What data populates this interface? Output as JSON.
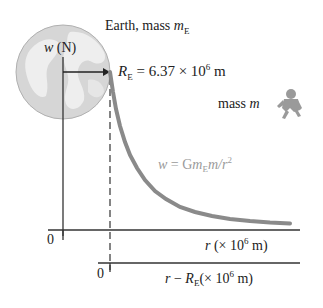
{
  "earth_label": {
    "text": "Earth, mass ",
    "var": "m",
    "sub": "E"
  },
  "y_axis_label": {
    "var": "w",
    "unit": " (N)"
  },
  "radius_label": {
    "var": "R",
    "sub": "E",
    "eq": " = 6.37 × 10",
    "exp": "6",
    "unit": " m"
  },
  "mass_label": {
    "text": "mass ",
    "var": "m"
  },
  "formula": {
    "lhs": "w",
    "eq": " = G",
    "m1": "m",
    "m1sub": "E",
    "m2": "m/r",
    "exp": "2"
  },
  "axis_r": {
    "zero": "0",
    "var": "r",
    "unit_pre": " (× 10",
    "exp": "6",
    "unit_post": " m)"
  },
  "axis_r_minus": {
    "zero": "0",
    "var": "r",
    "minus": " − ",
    "var2": "R",
    "sub": "E",
    "unit_pre": "(× 10",
    "exp": "6",
    "unit_post": " m)"
  },
  "colors": {
    "curve": "#8a8a8a",
    "axis": "#333333",
    "globe": "#dcdcdc",
    "globe_land": "#ececec",
    "formula": "#9a9a9a"
  }
}
